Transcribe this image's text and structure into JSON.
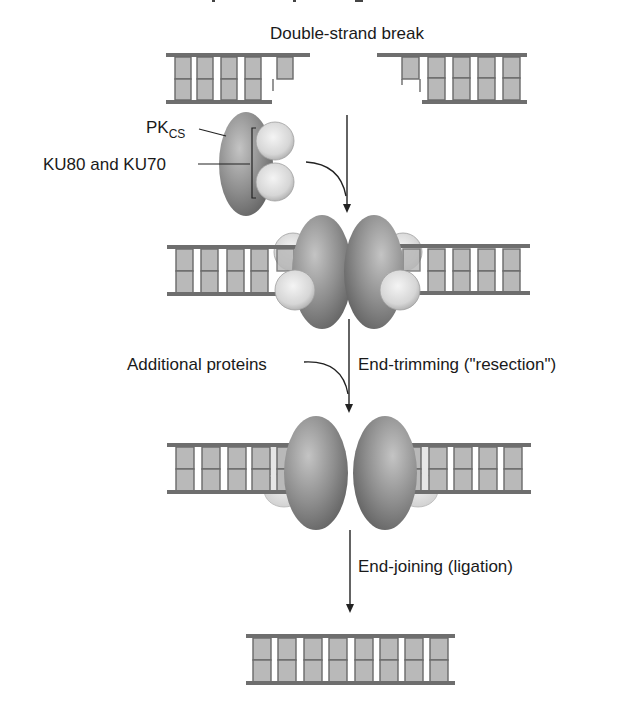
{
  "figure": {
    "title_cutoff_visible": true,
    "steps": [
      {
        "id": "break",
        "label": "Double-strand break",
        "description": "Two DNA duplex ends with staggered single-stranded overhangs"
      },
      {
        "id": "binding",
        "label": "",
        "proteins": {
          "pkcs_label_main": "PK",
          "pkcs_label_sub": "CS",
          "ku_label": "KU80 and KU70"
        }
      },
      {
        "id": "trimming",
        "label": "End-trimming (\"resection\")",
        "side_label": "Additional proteins"
      },
      {
        "id": "ligation",
        "label": "End-joining (ligation)"
      }
    ],
    "colors": {
      "strand": "#6e6e6e",
      "base": "#b9b9b9",
      "base_edge": "#6a6a6a",
      "pkcs_dark": "#6f6f6f",
      "pkcs_light": "#bdbdbd",
      "ku_ball": "#dcdcdc",
      "ku_pale": "#e4e4e4",
      "arrow": "#222222",
      "text": "#1a1a1a"
    },
    "dna": {
      "stage1_left_pairs": 4,
      "stage1_left_overhang_blocks": 1,
      "stage1_right_pairs": 4,
      "stage1_right_overhang_blocks": 1,
      "stage2_pairs_per_side": 5,
      "stage3_pairs_per_side": 5,
      "final_pairs": 8
    }
  }
}
